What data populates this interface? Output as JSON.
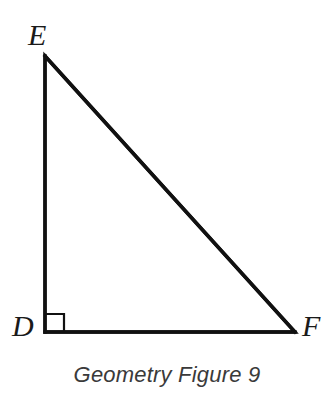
{
  "figure": {
    "caption": "Geometry Figure 9",
    "shape_name": "right-triangle",
    "background_color": "#ffffff",
    "stroke_color": "#111111",
    "label_color": "#1a1a1a",
    "caption_color": "#3a3a3a",
    "stroke_width": 3.4,
    "marker_stroke_width": 2.2,
    "vertices": [
      {
        "id": "E",
        "label": "E",
        "x": 45,
        "y": 56
      },
      {
        "id": "D",
        "label": "D",
        "x": 45,
        "y": 332
      },
      {
        "id": "F",
        "label": "F",
        "x": 295,
        "y": 332
      }
    ],
    "sides": [
      {
        "id": "DE",
        "name": "vertical-leg",
        "from": "D",
        "to": "E"
      },
      {
        "id": "DF",
        "name": "horizontal-leg",
        "from": "D",
        "to": "F"
      },
      {
        "id": "EF",
        "name": "hypotenuse",
        "from": "E",
        "to": "F"
      }
    ],
    "right_angle": {
      "at_vertex": "D",
      "marker": "square",
      "size": 18
    }
  }
}
